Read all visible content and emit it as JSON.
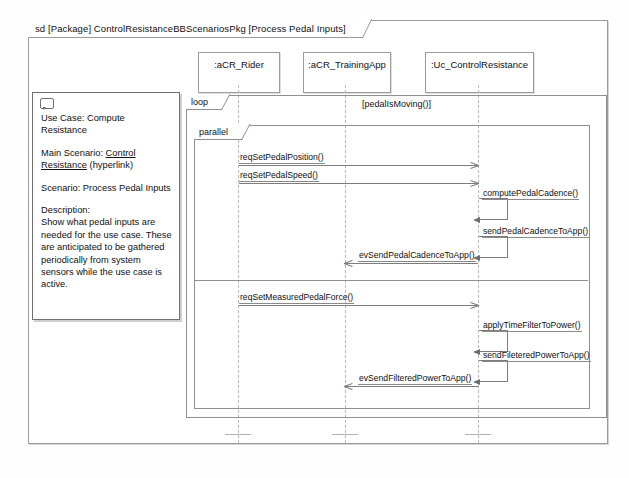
{
  "diagram": {
    "frame_label": "sd [Package] ControlResistanceBBScenariosPkg [Process Pedal Inputs]",
    "note_icon": "comment-icon"
  },
  "lifelines": [
    {
      "id": "rider",
      "label": ":aCR_Rider"
    },
    {
      "id": "trainingapp",
      "label": ":aCR_TrainingApp"
    },
    {
      "id": "control",
      "label": ":Uc_ControlResistance"
    }
  ],
  "fragments": {
    "loop": {
      "operator": "loop",
      "guard": "[pedalIsMoving()]"
    },
    "parallel": {
      "operator": "parallel"
    }
  },
  "note": {
    "line1": "Use Case: Compute Resistance",
    "line2_prefix": "Main Scenario: ",
    "line2_link": "Control Resistance",
    "line2_suffix": " (hyperlink)",
    "line3": "Scenario: Process Pedal Inputs",
    "line4_head": "Description:",
    "line4_body": "Show what pedal inputs are needed for the use case. These are anticipated to be gathered periodically from system sensors while the use case is active."
  },
  "messages": [
    {
      "id": "m1",
      "label": "reqSetPedalPosition()",
      "direction": "right"
    },
    {
      "id": "m2",
      "label": "reqSetPedalSpeed()",
      "direction": "right"
    },
    {
      "id": "m3",
      "label": "computePedalCadence()",
      "direction": "self"
    },
    {
      "id": "m4",
      "label": "sendPedalCadenceToApp()",
      "direction": "self"
    },
    {
      "id": "m5",
      "label": "evSendPedalCadenceToApp()",
      "direction": "left"
    },
    {
      "id": "m6",
      "label": "reqSetMeasuredPedalForce()",
      "direction": "right"
    },
    {
      "id": "m7",
      "label": "applyTimeFilterToPower()",
      "direction": "self"
    },
    {
      "id": "m8",
      "label": "sendFileteredPowerToApp()",
      "direction": "self"
    },
    {
      "id": "m9",
      "label": "evSendFilteredPowerToApp()",
      "direction": "left"
    }
  ],
  "colors": {
    "frame_border": "#9a9a9a",
    "fragment_border": "#8f8f8f",
    "message_line": "#7d7d7d",
    "lifeline_dash": "#b9b9b9",
    "background": "#ffffff"
  }
}
